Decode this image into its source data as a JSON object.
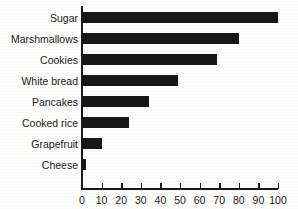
{
  "chart_data": {
    "type": "bar",
    "orientation": "horizontal",
    "title": "",
    "subtitle": "",
    "xlabel": "",
    "ylabel": "",
    "categories": [
      "Sugar",
      "Marshmallows",
      "Cookies",
      "White bread",
      "Pancakes",
      "Cooked rice",
      "Grapefruit",
      "Cheese"
    ],
    "values": [
      100,
      80,
      69,
      49,
      34,
      24,
      10,
      2
    ],
    "xlim": [
      0,
      100
    ],
    "xticks": [
      0,
      10,
      20,
      30,
      40,
      50,
      60,
      70,
      80,
      90,
      100
    ],
    "xtick_labels": [
      "0",
      "10",
      "20",
      "30",
      "40",
      "50",
      "60",
      "70",
      "80",
      "90",
      "100"
    ],
    "grid": false,
    "legend": false,
    "legend_position": "none",
    "bar_color": "#171717",
    "axis_color": "#1a1a1a",
    "text_color": "#1b1b1b",
    "background_color": "#fdfdfc"
  }
}
